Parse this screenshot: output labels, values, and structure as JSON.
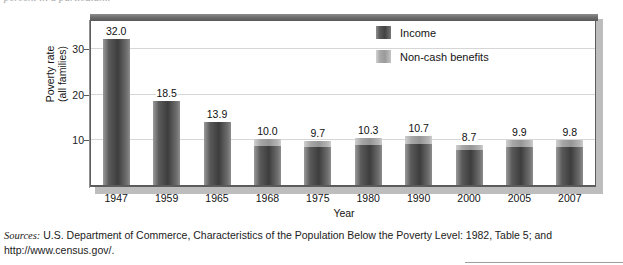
{
  "page": {
    "top_cutoff_text": "percent in a particular...",
    "bottom_rule": "rule"
  },
  "chart_data": {
    "type": "bar",
    "title": "",
    "subtitle": "",
    "xlabel": "Year",
    "ylabel": "Poverty rate\n(all families)",
    "ylabel_line1": "Poverty rate",
    "ylabel_line2": "(all families)",
    "categories": [
      "1947",
      "1959",
      "1965",
      "1968",
      "1975",
      "1980",
      "1990",
      "2000",
      "2005",
      "2007"
    ],
    "values": [
      32.0,
      18.5,
      13.9,
      10.0,
      9.7,
      10.3,
      10.7,
      8.7,
      9.9,
      9.8
    ],
    "data_labels": [
      "32.0",
      "18.5",
      "13.9",
      "10.0",
      "9.7",
      "10.3",
      "10.7",
      "8.7",
      "9.9",
      "9.8"
    ],
    "series": [
      {
        "name": "Income",
        "color": "#4a4a4a",
        "values": [
          32.0,
          18.5,
          13.9,
          8.6,
          8.3,
          8.8,
          9.0,
          7.6,
          8.4,
          8.3
        ]
      },
      {
        "name": "Non-cash benefits",
        "color": "#a8a8a8",
        "values": [
          0.0,
          0.0,
          0.0,
          1.4,
          1.4,
          1.5,
          1.7,
          1.1,
          1.5,
          1.5
        ]
      }
    ],
    "stacked": true,
    "ylim": [
      0,
      36
    ],
    "yticks": [
      10,
      20,
      30
    ],
    "ytick_labels": [
      "10",
      "20",
      "30"
    ],
    "grid": true,
    "legend_position": "top-right"
  },
  "legend": {
    "items": [
      {
        "label": "Income",
        "swatch": "dark-gray-swatch"
      },
      {
        "label": "Non-cash benefits",
        "swatch": "light-gray-swatch"
      }
    ]
  },
  "sources": {
    "lead": "Sources:",
    "text": " U.S. Department of Commerce, Characteristics of the Population Below the Poverty Level: 1982, Table 5; and http://www.census.gov/."
  }
}
